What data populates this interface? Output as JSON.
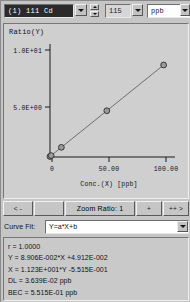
{
  "toolbar": {
    "element_selected": "(1) 111 Cd",
    "internal_standard": "115",
    "unit": "ppb",
    "spinner_up_icon": "caret-up-icon",
    "spinner_down_icon": "caret-down-icon",
    "dropdown_icon": "chevron-down-icon"
  },
  "plot": {
    "y_axis_label": "Ratio(Y)",
    "x_axis_label": "Conc.(X) [ppb]",
    "y_ticks": [
      "1.0E+01",
      "5.0E+00"
    ],
    "x_ticks": [
      "0",
      "50.00",
      "100.00"
    ]
  },
  "chart_data": {
    "type": "scatter",
    "title": "",
    "xlabel": "Conc.(X) [ppb]",
    "ylabel": "Ratio(Y)",
    "xlim": [
      0,
      110
    ],
    "ylim": [
      0,
      11
    ],
    "x_ticks": [
      0,
      50,
      100
    ],
    "x_tick_labels": [
      "0",
      "50.00",
      "100.00"
    ],
    "y_ticks": [
      5,
      10
    ],
    "y_tick_labels": [
      "5.0E+00",
      "1.0E+01"
    ],
    "grid": false,
    "legend": false,
    "series": [
      {
        "name": "111 Cd calibration",
        "marker": "filled-circle",
        "line": "fit-line",
        "x": [
          0,
          1,
          10,
          50,
          100
        ],
        "y": [
          0.049,
          0.138,
          0.94,
          4.502,
          8.955
        ]
      }
    ],
    "fit": {
      "model": "Y=a*X+b",
      "slope": 0.08906,
      "intercept": 0.04912,
      "r": 1.0
    }
  },
  "zoombar": {
    "back_all_label": "< -",
    "back_label": "",
    "ratio_label": "Zoom Ratio: 1",
    "zoom_in_label": "+",
    "forward_label": "++ >"
  },
  "curve_fit": {
    "label": "Curve Fit:",
    "value": "Y=a*X+b",
    "dropdown_icon": "chevron-down-icon"
  },
  "stats": {
    "lines": [
      "r = 1.0000",
      "Y = 8.906E-002*X +4.912E-002",
      "X = 1.123E+001*Y -5.515E-001",
      "DL = 3.639E-02 ppb",
      "BEC = 5.515E-01 ppb"
    ]
  }
}
